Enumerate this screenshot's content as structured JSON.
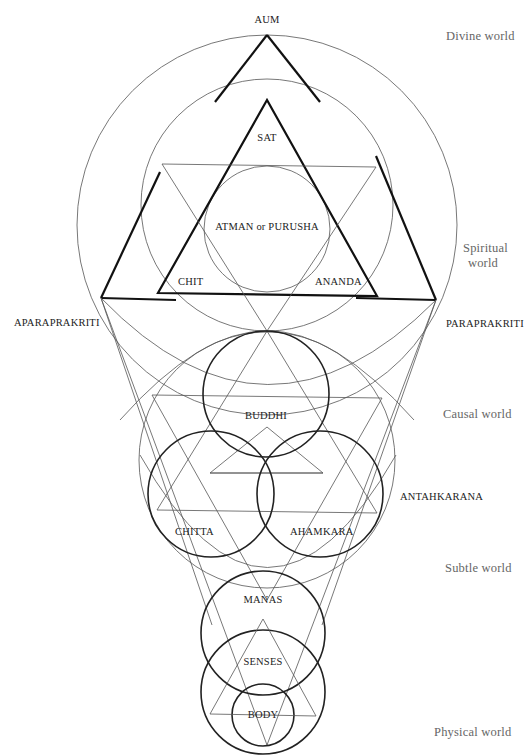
{
  "diagram": {
    "top_label": "AUM",
    "spiritual_triad": {
      "apex": "SAT",
      "left": "CHIT",
      "right": "ANANDA",
      "center": "ATMAN or PURUSHA"
    },
    "side_labels": {
      "left": "APARAPRAKRITI",
      "right": "PARAPRAKRITI",
      "lower_right": "ANTAHKARANA"
    },
    "inner_instruments": {
      "top": "BUDDHI",
      "left": "CHITTA",
      "right": "AHAMKARA",
      "bottom": "MANAS"
    },
    "senses": "SENSES",
    "body": "BODY"
  },
  "worlds": [
    {
      "line1": "Divine world",
      "line2": ""
    },
    {
      "line1": "Spiritual",
      "line2": "world"
    },
    {
      "line1": "Causal world",
      "line2": ""
    },
    {
      "line1": "Subtle world",
      "line2": ""
    },
    {
      "line1": "Physical world",
      "line2": ""
    }
  ],
  "colors": {
    "background": "#ffffff",
    "line_thick": "#111111",
    "line_thin": "#555555",
    "world_text": "#666666"
  }
}
